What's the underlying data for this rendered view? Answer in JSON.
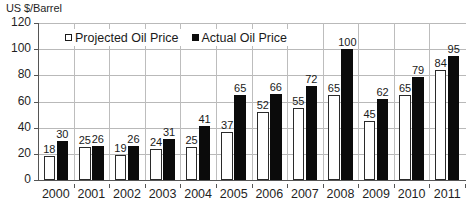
{
  "chart_data": {
    "type": "bar",
    "title": "US $/Barrel",
    "xlabel": "",
    "ylabel": "US $/Barrel",
    "ylim": [
      0,
      120
    ],
    "yticks": [
      0,
      20,
      40,
      60,
      80,
      100,
      120
    ],
    "grid": true,
    "legend_position": "top-left-inside",
    "categories": [
      "2000",
      "2001",
      "2002",
      "2003",
      "2004",
      "2005",
      "2006",
      "2007",
      "2008",
      "2009",
      "2010",
      "2011"
    ],
    "series": [
      {
        "name": "Projected Oil Price",
        "color": "#ffffff",
        "edge_color": "#1a1a1a",
        "values": [
          18,
          25,
          19,
          24,
          25,
          37,
          52,
          55,
          65,
          45,
          65,
          84
        ]
      },
      {
        "name": "Actual Oil Price",
        "color": "#0b0b0b",
        "edge_color": "#0b0b0b",
        "values": [
          30,
          26,
          26,
          31,
          41,
          65,
          66,
          72,
          100,
          62,
          79,
          95
        ]
      }
    ]
  },
  "legend": {
    "entries": [
      {
        "label": "Projected Oil Price",
        "swatch": "hollow-square-icon"
      },
      {
        "label": "Actual Oil Price",
        "swatch": "filled-square-icon"
      }
    ]
  },
  "axes": {
    "y_title": "US $/Barrel",
    "y_tick_labels": [
      "120",
      "100",
      "80",
      "60",
      "40",
      "20",
      "0"
    ],
    "x_tick_labels": [
      "2000",
      "2001",
      "2002",
      "2003",
      "2004",
      "2005",
      "2006",
      "2007",
      "2008",
      "2009",
      "2010",
      "2011"
    ]
  },
  "colors": {
    "projected": "#ffffff",
    "actual": "#0b0b0b",
    "gridline": "#b9b9b9",
    "axis": "#555555",
    "text": "#1a1a1a",
    "background": "#ffffff"
  }
}
